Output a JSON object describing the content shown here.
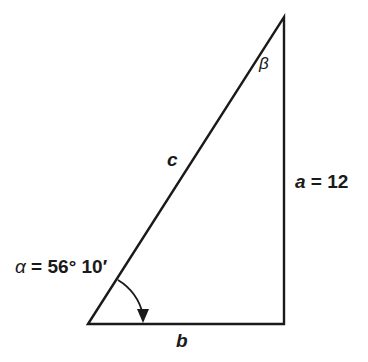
{
  "diagram": {
    "type": "right-triangle",
    "vertices": {
      "A": {
        "x": 88,
        "y": 324
      },
      "B": {
        "x": 284,
        "y": 17
      },
      "C": {
        "x": 284,
        "y": 324
      }
    },
    "right_angle_at": "C",
    "stroke_color": "#1a1a1a",
    "labels": {
      "beta": "β",
      "side_c": "c",
      "side_a_var": "a",
      "side_a_eq": " = 12",
      "alpha_var": "α",
      "alpha_eq": " = 56° 10′",
      "side_b": "b"
    },
    "given": {
      "a": 12,
      "alpha": "56° 10′"
    },
    "angle_arc": {
      "at": "A",
      "from": {
        "x": 118,
        "y": 279
      },
      "to": {
        "x": 143,
        "y": 322
      },
      "arrowhead": true
    }
  }
}
